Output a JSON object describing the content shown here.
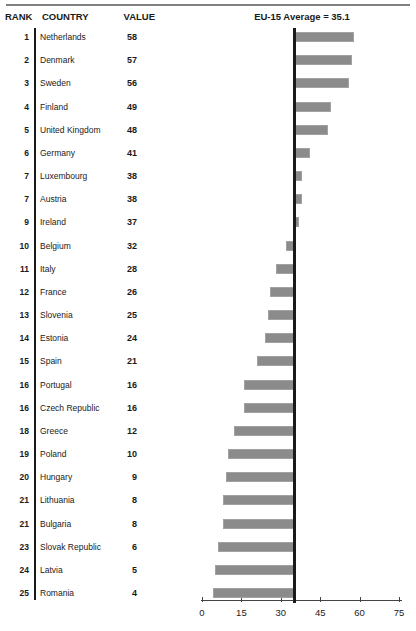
{
  "header": {
    "rank": "RANK",
    "country": "COUNTRY",
    "value": "VALUE",
    "average_label": "EU-15 Average = 35.1"
  },
  "colors": {
    "bar": "#8b8b8b",
    "bar_border": "#a2a2a2",
    "line": "#1a1a1a",
    "axis": "#444444",
    "rule": "#808080",
    "text": "#1a1a1a"
  },
  "chart_data": {
    "type": "bar",
    "orientation": "horizontal",
    "ranks": [
      1,
      2,
      3,
      4,
      5,
      6,
      7,
      7,
      9,
      10,
      11,
      12,
      13,
      14,
      15,
      16,
      16,
      18,
      19,
      20,
      21,
      21,
      23,
      24,
      25
    ],
    "categories": [
      "Netherlands",
      "Denmark",
      "Sweden",
      "Finland",
      "United Kingdom",
      "Germany",
      "Luxembourg",
      "Austria",
      "Ireland",
      "Belgium",
      "Italy",
      "France",
      "Slovenia",
      "Estonia",
      "Spain",
      "Portugal",
      "Czech Republic",
      "Greece",
      "Poland",
      "Hungary",
      "Lithuania",
      "Bulgaria",
      "Slovak Republic",
      "Latvia",
      "Romania"
    ],
    "values": [
      58,
      57,
      56,
      49,
      48,
      41,
      38,
      38,
      37,
      32,
      28,
      26,
      25,
      24,
      21,
      16,
      16,
      12,
      10,
      9,
      8,
      8,
      6,
      5,
      4
    ],
    "reference_line": {
      "label": "EU-15 Average = 35.1",
      "value": 35.1
    },
    "xlim": [
      0,
      75
    ],
    "xticks": [
      0,
      15,
      30,
      45,
      60,
      75
    ],
    "legend": "none",
    "bars_anchored_at_reference": true
  }
}
